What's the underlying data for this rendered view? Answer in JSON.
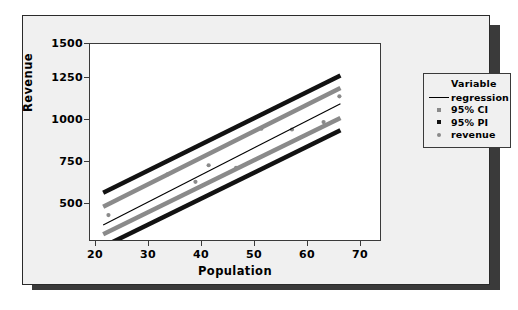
{
  "chart_data": {
    "type": "scatter",
    "title": "",
    "xlabel": "Population",
    "ylabel": "Revenue",
    "xlim": [
      17.5,
      72.5
    ],
    "ylim": [
      380,
      1560
    ],
    "xticks": [
      "20",
      "30",
      "40",
      "50",
      "60",
      "70"
    ],
    "xtick_values": [
      20,
      30,
      40,
      50,
      60,
      70
    ],
    "yticks": [
      "500",
      "750",
      "1000",
      "1250",
      "1500"
    ],
    "ytick_values": [
      500,
      750,
      1000,
      1250,
      1500
    ],
    "grid": false,
    "legend_position": "right",
    "series": [
      {
        "name": "revenue",
        "type": "scatter",
        "color": "#8a8a8a",
        "points": [
          {
            "x": 21.0,
            "y": 530
          },
          {
            "x": 32.2,
            "y": 775
          },
          {
            "x": 37.5,
            "y": 730
          },
          {
            "x": 40.0,
            "y": 830
          },
          {
            "x": 45.2,
            "y": 815
          },
          {
            "x": 50.0,
            "y": 1050
          },
          {
            "x": 55.8,
            "y": 1045
          },
          {
            "x": 61.8,
            "y": 1090
          },
          {
            "x": 64.8,
            "y": 1245
          }
        ]
      },
      {
        "name": "regression",
        "type": "line",
        "color": "#000000",
        "x": [
          20,
          65
        ],
        "values": [
          470,
          1200
        ]
      },
      {
        "name": "95% CI upper",
        "type": "line",
        "color": "#8a8a8a",
        "x": [
          20,
          65
        ],
        "values": [
          580,
          1295
        ]
      },
      {
        "name": "95% CI lower",
        "type": "line",
        "color": "#8a8a8a",
        "x": [
          20,
          65
        ],
        "values": [
          415,
          1115
        ]
      },
      {
        "name": "95% PI upper",
        "type": "line",
        "color": "#121212",
        "x": [
          20,
          65
        ],
        "values": [
          665,
          1370
        ]
      },
      {
        "name": "95% PI lower",
        "type": "line",
        "color": "#121212",
        "x": [
          20,
          65
        ],
        "values": [
          340,
          1040
        ]
      }
    ]
  },
  "legend": {
    "title": "Variable",
    "items": [
      {
        "label": "regression",
        "marker": "line",
        "color": "#000000"
      },
      {
        "label": "95% CI",
        "marker": "square",
        "color": "#8a8a8a"
      },
      {
        "label": "95% PI",
        "marker": "square",
        "color": "#121212"
      },
      {
        "label": "revenue",
        "marker": "circle",
        "color": "#8a8a8a"
      }
    ]
  },
  "axes": {
    "x_label": "Population",
    "y_label": "Revenue",
    "x_ticks": [
      "20",
      "30",
      "40",
      "50",
      "60",
      "70"
    ],
    "y_ticks": [
      "1500",
      "1250",
      "1000",
      "750",
      "500"
    ]
  },
  "colors": {
    "panel_background": "#f0f0f0",
    "plot_background": "#ffffff",
    "frame": "#3a3a3a",
    "shadow": "#3a3a3a",
    "ci_band": "#8a8a8a",
    "pi_band": "#121212",
    "regression_line": "#000000",
    "marker": "#8a8a8a"
  }
}
